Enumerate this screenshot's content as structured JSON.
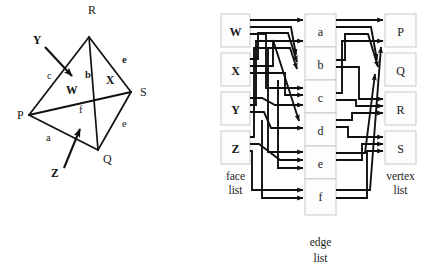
{
  "figure": {
    "left_panel": {
      "name": "tetrahedron-diagram",
      "vertices": [
        {
          "id": "P",
          "label": "P",
          "x": 29,
          "y": 115,
          "label_x": 17,
          "label_y": 119
        },
        {
          "id": "Q",
          "label": "Q",
          "x": 98,
          "y": 150,
          "label_x": 103,
          "label_y": 163
        },
        {
          "id": "R",
          "label": "R",
          "x": 89,
          "y": 37,
          "label_x": 88,
          "label_y": 14
        },
        {
          "id": "S",
          "label": "S",
          "x": 131,
          "y": 92,
          "label_x": 140,
          "label_y": 96
        }
      ],
      "edges": [
        {
          "id": "a",
          "label": "a",
          "from": "P",
          "to": "Q",
          "label_x": 46,
          "label_y": 141
        },
        {
          "id": "b",
          "label": "b",
          "from": "R",
          "to": "Q",
          "label_x": 85,
          "label_y": 78
        },
        {
          "id": "c",
          "label": "c",
          "from": "P",
          "to": "R",
          "label_x": 47,
          "label_y": 79
        },
        {
          "id": "d",
          "label": "e",
          "from": "R",
          "to": "S",
          "label_x": 122,
          "label_y": 63
        },
        {
          "id": "e",
          "label": "e",
          "from": "Q",
          "to": "S",
          "label_x": 122,
          "label_y": 127
        },
        {
          "id": "f",
          "label": "f",
          "from": "P",
          "to": "S",
          "label_x": 79,
          "label_y": 113
        }
      ],
      "face_labels": [
        {
          "id": "W",
          "label": "W",
          "x": 71,
          "y": 90
        },
        {
          "id": "X",
          "label": "X",
          "x": 111,
          "y": 80
        },
        {
          "id": "Y",
          "label": "Y",
          "x": 38,
          "y": 40
        },
        {
          "id": "Z",
          "label": "Z",
          "x": 56,
          "y": 173
        }
      ],
      "callouts": [
        {
          "id": "Y-arrow",
          "from_x": 44,
          "from_y": 46,
          "to_x": 73,
          "to_y": 78
        },
        {
          "id": "Z-arrow",
          "from_x": 63,
          "from_y": 168,
          "to_x": 80,
          "to_y": 128
        }
      ]
    },
    "right_panel": {
      "name": "linked-list-diagram",
      "columns": [
        {
          "id": "face-list",
          "caption_line1": "face",
          "caption_line2": "list",
          "items": [
            "W",
            "X",
            "Y",
            "Z"
          ]
        },
        {
          "id": "edge-list",
          "caption_line1": "edge",
          "caption_line2": "list",
          "items": [
            "a",
            "b",
            "c",
            "d",
            "e",
            "f"
          ]
        },
        {
          "id": "vertex-list",
          "caption_line1": "vertex",
          "caption_line2": "list",
          "items": [
            "P",
            "Q",
            "R",
            "S"
          ]
        }
      ],
      "face_to_edge_links": [
        {
          "face": "W",
          "edges": [
            "b",
            "c",
            "f"
          ]
        },
        {
          "face": "X",
          "edges": [
            "b",
            "d",
            "e"
          ]
        },
        {
          "face": "Y",
          "edges": [
            "c",
            "d",
            "a"
          ]
        },
        {
          "face": "Z",
          "edges": [
            "a",
            "e",
            "f"
          ]
        }
      ],
      "edge_to_vertex_links": [
        {
          "edge": "a",
          "vertices": [
            "P",
            "Q"
          ]
        },
        {
          "edge": "b",
          "vertices": [
            "Q",
            "R"
          ]
        },
        {
          "edge": "c",
          "vertices": [
            "P",
            "R"
          ]
        },
        {
          "edge": "d",
          "vertices": [
            "R",
            "S"
          ]
        },
        {
          "edge": "e",
          "vertices": [
            "Q",
            "S"
          ]
        },
        {
          "edge": "f",
          "vertices": [
            "P",
            "S"
          ]
        }
      ]
    }
  },
  "colors": {
    "stroke": "#111111",
    "box_border": "#c9c9c9",
    "box_fill": "#fdfdfd",
    "background": "#ffffff",
    "text": "#1a1a1a"
  }
}
